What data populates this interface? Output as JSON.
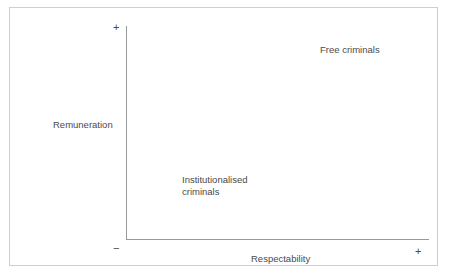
{
  "figure": {
    "background_color": "#ffffff",
    "frame_color": "#cfcfcf",
    "axis_color": "#9a9a9a",
    "text_color": "#4a4a4a"
  },
  "axes": {
    "y": {
      "title": "Remuneration",
      "positive_sign": "+",
      "negative_sign": "−"
    },
    "x": {
      "title": "Respectability",
      "positive_sign": "+",
      "negative_sign": "−"
    }
  },
  "quadrant_labels": {
    "upper_right": "Free criminals",
    "lower_left": "Institutionalised\ncriminals"
  },
  "chart_data": {
    "type": "scatter",
    "title": "",
    "subtitle": "",
    "xlabel": "Respectability",
    "ylabel": "Remuneration",
    "xlim": [
      "−",
      "+"
    ],
    "ylim": [
      "",
      "+"
    ],
    "grid": false,
    "legend": "none",
    "x_tick_labels": [
      "−",
      "+"
    ],
    "y_tick_labels": [
      "+"
    ],
    "annotations": [
      {
        "text": "Free criminals",
        "quadrant": "upper-right",
        "x": "high",
        "y": "high"
      },
      {
        "text": "Institutionalised criminals",
        "quadrant": "lower-left",
        "x": "low",
        "y": "low"
      }
    ],
    "series": [],
    "categories": [],
    "values": []
  }
}
